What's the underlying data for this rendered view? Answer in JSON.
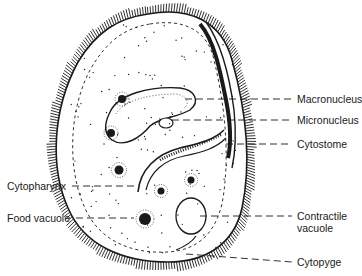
{
  "diagram": {
    "labels_right": [
      {
        "id": "macronucleus",
        "text": "Macronucleus"
      },
      {
        "id": "micronucleus",
        "text": "Micronucleus"
      },
      {
        "id": "cytostome",
        "text": "Cytostome"
      },
      {
        "id": "contractile-vacuole",
        "text": "Contractile",
        "text2": "vacuole"
      },
      {
        "id": "cytopyge",
        "text": "Cytopyge"
      }
    ],
    "labels_left": [
      {
        "id": "cytopharynx",
        "text": "Cytopharynx"
      },
      {
        "id": "food-vacuole",
        "text": "Food vacuole"
      }
    ],
    "colors": {
      "ink": "#1a1a1a",
      "background": "#ffffff"
    }
  }
}
